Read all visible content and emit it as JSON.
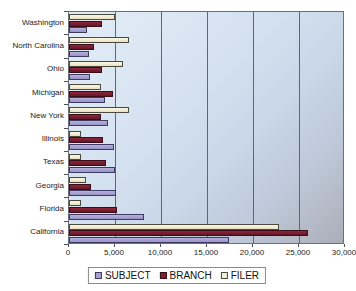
{
  "chart_data": {
    "type": "bar",
    "orientation": "horizontal",
    "title": "",
    "xlabel": "",
    "ylabel": "",
    "xlim": [
      0,
      30000
    ],
    "xticks": [
      0,
      5000,
      10000,
      15000,
      20000,
      25000,
      30000
    ],
    "xtick_labels": [
      "0",
      "5,000",
      "10,000",
      "15,000",
      "20,000",
      "25,000",
      "30,000"
    ],
    "grid": true,
    "grid_axis": "x",
    "legend_position": "bottom",
    "categories": [
      "Washington",
      "North Carolina",
      "Ohio",
      "Michigan",
      "New York",
      "Illinois",
      "Texas",
      "Georgia",
      "Florida",
      "California"
    ],
    "series": [
      {
        "name": "SUBJECT",
        "color": "#a7a1d2",
        "values": [
          2000,
          2200,
          2300,
          3900,
          4200,
          4900,
          5000,
          5100,
          8100,
          17400
        ]
      },
      {
        "name": "BRANCH",
        "color": "#7a1f30",
        "values": [
          3600,
          2700,
          3600,
          4800,
          3500,
          3700,
          4000,
          2400,
          5200,
          26000
        ]
      },
      {
        "name": "FILER",
        "color": "#f4eed6",
        "values": [
          5000,
          6500,
          5900,
          3500,
          6500,
          1300,
          1300,
          1800,
          1300,
          22800
        ]
      }
    ]
  },
  "legend": {
    "items": [
      {
        "label": "SUBJECT",
        "swatch": "subject"
      },
      {
        "label": "BRANCH",
        "swatch": "branch"
      },
      {
        "label": "FILER",
        "swatch": "filer"
      }
    ]
  }
}
